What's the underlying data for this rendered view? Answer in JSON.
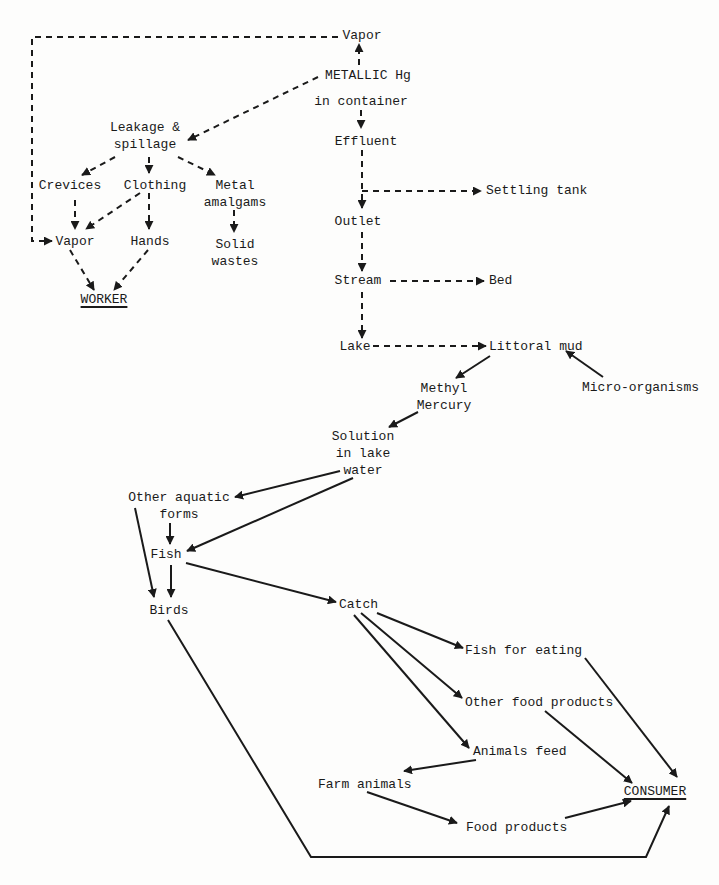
{
  "diagram": {
    "type": "flowchart",
    "legend": {
      "dashed": "mercury handling / release pathways",
      "solid": "biological / food chain pathways"
    },
    "colors": {
      "ink": "#1a1a1a",
      "background": "#fdfdfc"
    },
    "nodes": {
      "vapor_top": "Vapor",
      "metallic_hg": "METALLIC Hg",
      "in_container": "in container",
      "leakage": "Leakage &\nspillage",
      "effluent": "Effluent",
      "crevices": "Crevices",
      "clothing": "Clothing",
      "metal_amalgams": "Metal\namalgams",
      "settling_tank": "Settling tank",
      "vapor_worker": "Vapor",
      "hands": "Hands",
      "solid_wastes": "Solid\nwastes",
      "outlet": "Outlet",
      "worker": "WORKER",
      "stream": "Stream",
      "bed": "Bed",
      "lake": "Lake",
      "littoral_mud": "Littoral mud",
      "methyl_mercury": "Methyl\nMercury",
      "micro_organisms": "Micro-organisms",
      "solution": "Solution\nin lake\nwater",
      "other_aquatic": "Other aquatic\nforms",
      "fish": "Fish",
      "birds": "Birds",
      "catch": "Catch",
      "fish_for_eating": "Fish for eating",
      "other_food_products": "Other food products",
      "animals_feed": "Animals feed",
      "farm_animals": "Farm animals",
      "consumer": "CONSUMER",
      "food_products": "Food products"
    },
    "edges": [
      {
        "from": "METALLIC Hg",
        "to": "Vapor",
        "style": "dashed"
      },
      {
        "from": "METALLIC Hg",
        "to": "Leakage & spillage",
        "style": "dashed"
      },
      {
        "from": "in container",
        "to": "Effluent",
        "style": "dashed"
      },
      {
        "from": "Vapor",
        "to": "Vapor (worker)",
        "style": "dashed"
      },
      {
        "from": "Leakage & spillage",
        "to": "Crevices",
        "style": "dashed"
      },
      {
        "from": "Leakage & spillage",
        "to": "Clothing",
        "style": "dashed"
      },
      {
        "from": "Leakage & spillage",
        "to": "Metal amalgams",
        "style": "dashed"
      },
      {
        "from": "Crevices",
        "to": "Vapor (worker)",
        "style": "dashed"
      },
      {
        "from": "Clothing",
        "to": "Vapor (worker)",
        "style": "dashed"
      },
      {
        "from": "Clothing",
        "to": "Hands",
        "style": "dashed"
      },
      {
        "from": "Metal amalgams",
        "to": "Solid wastes",
        "style": "dashed"
      },
      {
        "from": "Vapor (worker)",
        "to": "WORKER",
        "style": "dashed"
      },
      {
        "from": "Hands",
        "to": "WORKER",
        "style": "dashed"
      },
      {
        "from": "Effluent",
        "to": "Settling tank",
        "style": "dashed"
      },
      {
        "from": "Effluent",
        "to": "Outlet",
        "style": "dashed"
      },
      {
        "from": "Outlet",
        "to": "Stream",
        "style": "dashed"
      },
      {
        "from": "Stream",
        "to": "Bed",
        "style": "dashed"
      },
      {
        "from": "Stream",
        "to": "Lake",
        "style": "dashed"
      },
      {
        "from": "Lake",
        "to": "Littoral mud",
        "style": "dashed"
      },
      {
        "from": "Micro-organisms",
        "to": "Littoral mud",
        "style": "solid"
      },
      {
        "from": "Littoral mud",
        "to": "Methyl Mercury",
        "style": "solid"
      },
      {
        "from": "Methyl Mercury",
        "to": "Solution in lake water",
        "style": "solid"
      },
      {
        "from": "Solution in lake water",
        "to": "Other aquatic forms",
        "style": "solid"
      },
      {
        "from": "Solution in lake water",
        "to": "Fish",
        "style": "solid"
      },
      {
        "from": "Other aquatic forms",
        "to": "Fish",
        "style": "solid"
      },
      {
        "from": "Other aquatic forms",
        "to": "Birds",
        "style": "solid"
      },
      {
        "from": "Fish",
        "to": "Birds",
        "style": "solid"
      },
      {
        "from": "Fish",
        "to": "Catch",
        "style": "solid"
      },
      {
        "from": "Catch",
        "to": "Fish for eating",
        "style": "solid"
      },
      {
        "from": "Catch",
        "to": "Other food products",
        "style": "solid"
      },
      {
        "from": "Catch",
        "to": "Animals feed",
        "style": "solid"
      },
      {
        "from": "Animals feed",
        "to": "Farm animals",
        "style": "solid"
      },
      {
        "from": "Farm animals",
        "to": "Food products",
        "style": "solid"
      },
      {
        "from": "Fish for eating",
        "to": "CONSUMER",
        "style": "solid"
      },
      {
        "from": "Other food products",
        "to": "CONSUMER",
        "style": "solid"
      },
      {
        "from": "Food products",
        "to": "CONSUMER",
        "style": "solid"
      },
      {
        "from": "Birds",
        "to": "CONSUMER",
        "style": "solid"
      }
    ]
  }
}
